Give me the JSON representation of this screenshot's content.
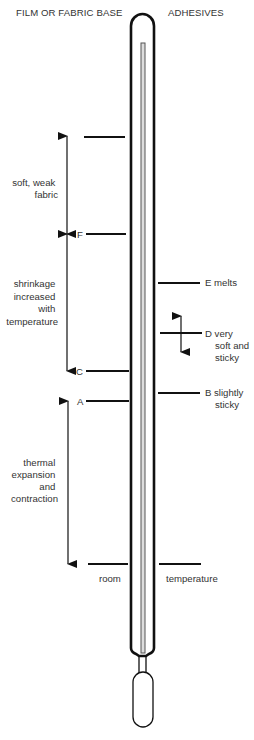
{
  "headers": {
    "left": "FILM OR FABRIC BASE",
    "right": "ADHESIVES"
  },
  "left_markers": [
    {
      "id": "top",
      "label": ""
    },
    {
      "id": "F",
      "label": "F"
    },
    {
      "id": "C",
      "label": "C"
    },
    {
      "id": "A",
      "label": "A"
    },
    {
      "id": "room",
      "label": ""
    }
  ],
  "right_markers": [
    {
      "id": "E",
      "label_lines": [
        "E melts"
      ]
    },
    {
      "id": "D",
      "label_lines": [
        "D very",
        "soft and",
        "sticky"
      ]
    },
    {
      "id": "B",
      "label_lines": [
        "B slightly",
        "sticky"
      ]
    },
    {
      "id": "room",
      "label_lines": []
    }
  ],
  "ranges": [
    {
      "id": "soft-weak-fabric",
      "label_lines": [
        "soft, weak",
        "fabric"
      ]
    },
    {
      "id": "shrinkage",
      "label_lines": [
        "shrinkage",
        "increased",
        "with",
        "temperature"
      ]
    },
    {
      "id": "thermal-expansion",
      "label_lines": [
        "thermal",
        "expansion",
        "and",
        "contraction"
      ]
    }
  ],
  "room_temperature": {
    "left": "room",
    "right": "temperature"
  },
  "colors": {
    "ink": "#111111",
    "text": "#333333",
    "capillary": "#666666"
  }
}
